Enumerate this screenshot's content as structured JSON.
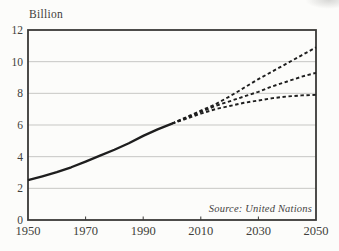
{
  "chart": {
    "unit_label": "Billion",
    "source_note": "Source: United Nations"
  },
  "chart_data": {
    "type": "line",
    "xlabel": "",
    "ylabel": "Billion",
    "xlim": [
      1950,
      2050
    ],
    "ylim": [
      0,
      12
    ],
    "x_ticks": [
      1950,
      1970,
      1990,
      2010,
      2030,
      2050
    ],
    "y_ticks": [
      0,
      2,
      4,
      6,
      8,
      10,
      12
    ],
    "grid": "horizontal",
    "legend": "none",
    "annotation": "Source: United Nations",
    "colors": {
      "line": "#1e1e1e",
      "frame": "#3a3937",
      "grid": "#c7c7c4",
      "text": "#413f3b"
    },
    "series": [
      {
        "name": "historical",
        "style": "solid",
        "x": [
          1950,
          1955,
          1960,
          1965,
          1970,
          1975,
          1980,
          1985,
          1990,
          1995,
          2000
        ],
        "values": [
          2.52,
          2.76,
          3.02,
          3.33,
          3.69,
          4.07,
          4.44,
          4.85,
          5.31,
          5.72,
          6.09
        ]
      },
      {
        "name": "high-projection",
        "style": "dashed",
        "x": [
          2000,
          2005,
          2010,
          2015,
          2020,
          2025,
          2030,
          2035,
          2040,
          2045,
          2050
        ],
        "values": [
          6.09,
          6.5,
          6.9,
          7.3,
          7.8,
          8.35,
          8.9,
          9.4,
          9.9,
          10.4,
          10.9
        ]
      },
      {
        "name": "medium-projection",
        "style": "dashed",
        "x": [
          2000,
          2005,
          2010,
          2015,
          2020,
          2025,
          2030,
          2035,
          2040,
          2045,
          2050
        ],
        "values": [
          6.09,
          6.45,
          6.83,
          7.2,
          7.5,
          7.8,
          8.1,
          8.45,
          8.75,
          9.05,
          9.3
        ]
      },
      {
        "name": "low-projection",
        "style": "dashed",
        "x": [
          2000,
          2005,
          2010,
          2015,
          2020,
          2025,
          2030,
          2035,
          2040,
          2045,
          2050
        ],
        "values": [
          6.09,
          6.4,
          6.72,
          7.0,
          7.2,
          7.4,
          7.55,
          7.7,
          7.8,
          7.87,
          7.9
        ]
      }
    ]
  }
}
